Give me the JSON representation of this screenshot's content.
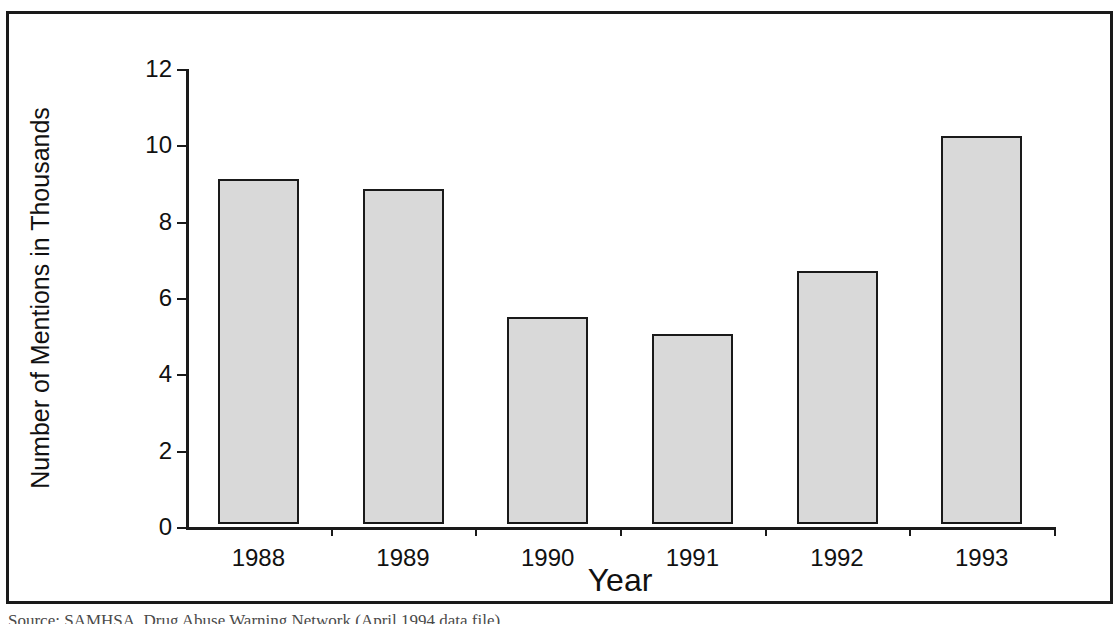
{
  "figure": {
    "source_caption": "Source: SAMHSA, Drug Abuse Warning Network (April 1994 data file)",
    "frame_color": "#1a1a1a",
    "background_color": "#ffffff"
  },
  "chart_data": {
    "type": "bar",
    "title": "",
    "xlabel": "Year",
    "ylabel": "Number of Mentions in Thousands",
    "categories": [
      "1988",
      "1989",
      "1990",
      "1991",
      "1992",
      "1993"
    ],
    "values": [
      9.05,
      8.78,
      5.42,
      4.98,
      6.62,
      10.16
    ],
    "ylim": [
      0,
      12
    ],
    "yticks": [
      0,
      2,
      4,
      6,
      8,
      10,
      12
    ],
    "ytick_labels": [
      "0",
      "2",
      "4",
      "6",
      "8",
      "10",
      "12"
    ],
    "grid": false,
    "legend": null,
    "bar_fill_color": "#d9d9d9",
    "bar_edge_color": "#1a1a1a"
  }
}
